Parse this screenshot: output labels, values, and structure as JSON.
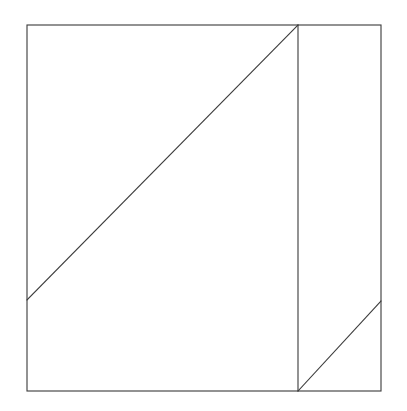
{
  "figure": {
    "canvas": {
      "width": 407,
      "height": 411,
      "background_color": "#ffffff"
    },
    "style": {
      "stroke_color": "#3a3a3a",
      "stroke_width": 1.1,
      "fill_color": "none"
    },
    "shapes": [
      {
        "name": "outer-square",
        "type": "rect",
        "x": 27,
        "y": 25,
        "width": 354,
        "height": 366,
        "label": "Outer square"
      },
      {
        "name": "vertical-divider",
        "type": "line",
        "x1": 298,
        "y1": 25,
        "x2": 298,
        "y2": 391,
        "label": "Vertical divider"
      },
      {
        "name": "main-diagonal",
        "type": "line",
        "x1": 27,
        "y1": 300,
        "x2": 298,
        "y2": 25,
        "label": "Main diagonal"
      },
      {
        "name": "lower-right-diagonal",
        "type": "line",
        "x1": 298,
        "y1": 391,
        "x2": 381,
        "y2": 301,
        "label": "Lower right diagonal"
      }
    ],
    "vertices": {
      "top_left": "(27, 25)",
      "top_right": "(381, 25)",
      "bottom_left": "(27, 391)",
      "bottom_right": "(381, 391)",
      "divider_top": "(298, 25)",
      "divider_bottom": "(298, 391)",
      "diagonal_left_endpoint": "(27, 300)",
      "diagonal_right_endpoint": "(381, 301)"
    }
  }
}
